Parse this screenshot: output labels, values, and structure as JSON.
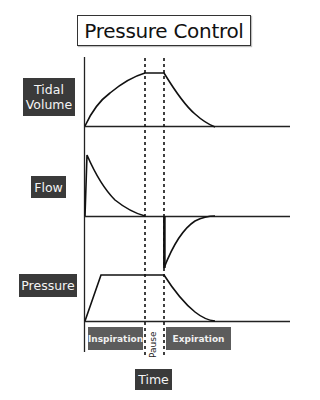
{
  "title": "Pressure Control",
  "panels": [
    {
      "label_line1": "Tidal",
      "label_line2": "Volume",
      "waveform": "tidal-volume"
    },
    {
      "label": "Flow",
      "waveform": "flow"
    },
    {
      "label": "Pressure",
      "waveform": "pressure"
    }
  ],
  "phases": {
    "inspiration": "Inspiration",
    "pause": "Pause",
    "expiration": "Expiration"
  },
  "x_axis_label": "Time",
  "colors": {
    "label_bg": "#3a3a3a",
    "phase_bg": "#5c5c5c",
    "line": "#111111"
  }
}
